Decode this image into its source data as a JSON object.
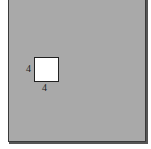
{
  "figure": {
    "outer_fill": "#a9a9a9",
    "inner_fill": "#ffffff",
    "square_labels": {
      "left": "4",
      "bottom": "4"
    },
    "caption_fragment": "–"
  }
}
